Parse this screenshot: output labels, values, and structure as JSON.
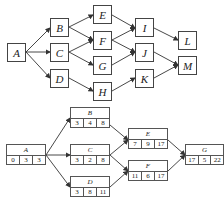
{
  "top_diagram": {
    "nodes": [
      {
        "id": "A",
        "label": "A"
      },
      {
        "id": "B",
        "label": "B"
      },
      {
        "id": "C",
        "label": "C"
      },
      {
        "id": "D",
        "label": "D"
      },
      {
        "id": "E",
        "label": "E"
      },
      {
        "id": "F",
        "label": "F"
      },
      {
        "id": "G",
        "label": "G"
      },
      {
        "id": "H",
        "label": "H"
      },
      {
        "id": "I",
        "label": "I"
      },
      {
        "id": "J",
        "label": "J"
      },
      {
        "id": "K",
        "label": "K"
      },
      {
        "id": "L",
        "label": "L"
      },
      {
        "id": "M",
        "label": "M"
      }
    ],
    "edges": [
      [
        "A",
        "B"
      ],
      [
        "A",
        "C"
      ],
      [
        "A",
        "D"
      ],
      [
        "B",
        "E"
      ],
      [
        "B",
        "F"
      ],
      [
        "C",
        "F"
      ],
      [
        "C",
        "G"
      ],
      [
        "D",
        "H"
      ],
      [
        "E",
        "I"
      ],
      [
        "F",
        "I"
      ],
      [
        "F",
        "J"
      ],
      [
        "G",
        "J"
      ],
      [
        "H",
        "K"
      ],
      [
        "I",
        "L"
      ],
      [
        "J",
        "M"
      ],
      [
        "K",
        "M"
      ]
    ]
  },
  "bottom_diagram": {
    "nodes": [
      {
        "id": "A",
        "label": "A",
        "values": [
          "0",
          "3",
          "3"
        ]
      },
      {
        "id": "B",
        "label": "B",
        "values": [
          "3",
          "4",
          "8"
        ]
      },
      {
        "id": "C",
        "label": "C",
        "values": [
          "3",
          "2",
          "8"
        ]
      },
      {
        "id": "D",
        "label": "D",
        "values": [
          "3",
          "8",
          "11"
        ]
      },
      {
        "id": "E",
        "label": "E",
        "values": [
          "7",
          "9",
          "17"
        ]
      },
      {
        "id": "F",
        "label": "F",
        "values": [
          "11",
          "6",
          "17"
        ]
      },
      {
        "id": "G",
        "label": "G",
        "values": [
          "17",
          "5",
          "22"
        ]
      }
    ],
    "edges": [
      [
        "A",
        "B"
      ],
      [
        "A",
        "C"
      ],
      [
        "A",
        "D"
      ],
      [
        "B",
        "E"
      ],
      [
        "C",
        "E"
      ],
      [
        "C",
        "F"
      ],
      [
        "D",
        "F"
      ],
      [
        "E",
        "G"
      ],
      [
        "F",
        "G"
      ]
    ]
  }
}
